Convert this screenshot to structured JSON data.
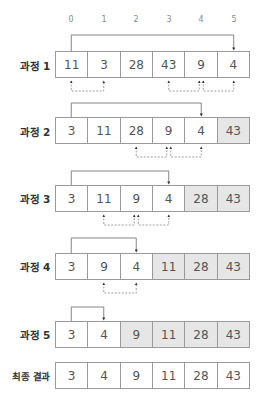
{
  "indices": [
    "0",
    "1",
    "2",
    "3",
    "4",
    "5"
  ],
  "colors": {
    "sorted_fill": "#e6e6e6",
    "border": "#9a9a9a",
    "text": "#555555",
    "label": "#333333",
    "index": "#8a8a8a"
  },
  "rows": [
    {
      "label": "과정 1",
      "values": [
        "11",
        "3",
        "28",
        "43",
        "9",
        "4"
      ],
      "sorted_from": 6,
      "bracket_target": 5,
      "swaps": [
        [
          0,
          1
        ],
        [
          3,
          4
        ],
        [
          4,
          5
        ]
      ]
    },
    {
      "label": "과정 2",
      "values": [
        "3",
        "11",
        "28",
        "9",
        "4",
        "43"
      ],
      "sorted_from": 5,
      "bracket_target": 4,
      "swaps": [
        [
          2,
          3
        ],
        [
          3,
          4
        ]
      ]
    },
    {
      "label": "과정 3",
      "values": [
        "3",
        "11",
        "9",
        "4",
        "28",
        "43"
      ],
      "sorted_from": 4,
      "bracket_target": 3,
      "swaps": [
        [
          1,
          2
        ],
        [
          2,
          3
        ]
      ]
    },
    {
      "label": "과정 4",
      "values": [
        "3",
        "9",
        "4",
        "11",
        "28",
        "43"
      ],
      "sorted_from": 3,
      "bracket_target": 2,
      "swaps": [
        [
          1,
          2
        ]
      ]
    },
    {
      "label": "과정 5",
      "values": [
        "3",
        "4",
        "9",
        "11",
        "28",
        "43"
      ],
      "sorted_from": 2,
      "bracket_target": 1,
      "swaps": []
    }
  ],
  "final": {
    "label": "최종 결과",
    "values": [
      "3",
      "4",
      "9",
      "11",
      "28",
      "43"
    ]
  }
}
